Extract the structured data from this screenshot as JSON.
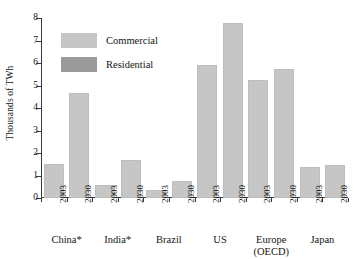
{
  "chart_data": {
    "type": "bar",
    "title": "",
    "xlabel": "",
    "ylabel": "Thousands of TWh",
    "ylim": [
      0,
      8
    ],
    "yticks": [
      0,
      1,
      2,
      3,
      4,
      5,
      6,
      7,
      8
    ],
    "ytick_labels": [
      "0",
      "1",
      "2",
      "3",
      "4",
      "5",
      "6",
      "7",
      "8"
    ],
    "grid": false,
    "legend_position": "upper-left-inside",
    "legend": [
      {
        "name": "Commercial",
        "color": "#c6c6c6"
      },
      {
        "name": "Residential",
        "color": "#9a9a9a"
      }
    ],
    "groups": [
      {
        "label": "China*",
        "label_line2": ""
      },
      {
        "label": "India*",
        "label_line2": ""
      },
      {
        "label": "Brazil",
        "label_line2": ""
      },
      {
        "label": "US",
        "label_line2": ""
      },
      {
        "label": "Europe",
        "label_line2": "(OECD)"
      },
      {
        "label": "Japan",
        "label_line2": ""
      }
    ],
    "categories": [
      "China* 2003",
      "China* 2030",
      "India* 2003",
      "India* 2030",
      "Brazil 2003",
      "Brazil 2030",
      "US 2003",
      "US 2030",
      "Europe (OECD) 2003",
      "Europe (OECD) 2030",
      "Japan 2003",
      "Japan 2030"
    ],
    "tick_labels": [
      "2003",
      "2030",
      "2003",
      "2030",
      "2003",
      "2030",
      "2003",
      "2030",
      "2003",
      "2030",
      "2003",
      "2030"
    ],
    "values": [
      1.5,
      4.65,
      0.6,
      1.7,
      0.35,
      0.75,
      5.9,
      7.8,
      5.25,
      5.75,
      1.4,
      1.45
    ],
    "series": [
      {
        "name": "Commercial",
        "values": [
          1.5,
          4.65,
          0.6,
          1.7,
          0.35,
          0.75,
          5.9,
          7.8,
          5.25,
          5.75,
          1.4,
          1.45
        ]
      }
    ],
    "axis_color": "#3a3a3a",
    "bar_color": "#c6c6c6"
  }
}
